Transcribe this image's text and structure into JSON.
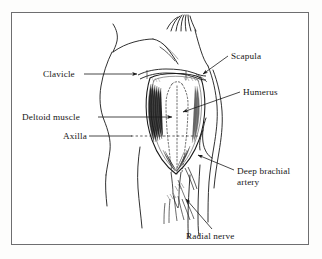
{
  "figure": {
    "domain_kind": "anatomical-line-drawing",
    "title": "",
    "caption": "",
    "background_color": "#ffffff",
    "frame_color": "#6e6e70",
    "ink_color": "#1a1a1a"
  },
  "labels": {
    "clavicle": "Clavicle",
    "deltoid_muscle": "Deltoid muscle",
    "axilla": "Axilla",
    "scapula": "Scapula",
    "humerus": "Humerus",
    "deep_brachial_artery_line1": "Deep brachial",
    "deep_brachial_artery_line2": "artery",
    "radial_nerve": "Radial nerve"
  },
  "label_list": [
    {
      "key": "clavicle",
      "text": "Clavicle",
      "side": "left",
      "leader": "solid-with-arrowhead"
    },
    {
      "key": "deltoid_muscle",
      "text": "Deltoid muscle",
      "side": "left",
      "leader": "solid-with-arrowhead"
    },
    {
      "key": "axilla",
      "text": "Axilla",
      "side": "left",
      "leader": "solid-then-dashed"
    },
    {
      "key": "scapula",
      "text": "Scapula",
      "side": "right",
      "leader": "solid-with-arrowhead"
    },
    {
      "key": "humerus",
      "text": "Humerus",
      "side": "right",
      "leader": "solid-with-arrowhead"
    },
    {
      "key": "deep_brachial_artery",
      "text": "Deep brachial artery",
      "side": "right",
      "leader": "solid-with-arrowhead"
    },
    {
      "key": "radial_nerve",
      "text": "Radial nerve",
      "side": "bottom",
      "leader": "solid-with-arrowhead"
    }
  ]
}
